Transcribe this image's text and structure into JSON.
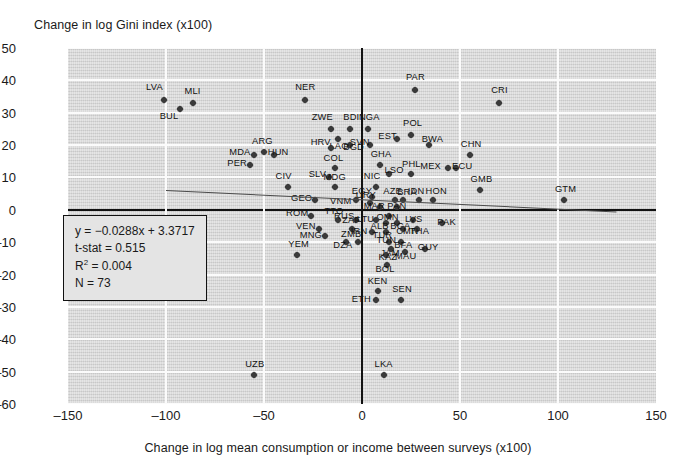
{
  "chart_data": {
    "type": "scatter",
    "title": "",
    "ylabel": "Change in log Gini index (x100)",
    "xlabel": "Change in log mean consumption or income between surveys (x100)",
    "xlim": [
      -150,
      150
    ],
    "ylim": [
      -60,
      50
    ],
    "xticks": [
      -150,
      -100,
      -50,
      0,
      50,
      100,
      150
    ],
    "yticks": [
      50,
      40,
      30,
      20,
      10,
      0,
      -10,
      -20,
      -30,
      -40,
      -50,
      -60
    ],
    "xtick_labels": [
      "–150",
      "–100",
      "–50",
      "0",
      "50",
      "100",
      "150"
    ],
    "ytick_labels": [
      "50",
      "40",
      "30",
      "20",
      "10",
      "0",
      "–10",
      "–20",
      "–30",
      "–40",
      "–50",
      "–60"
    ],
    "grid": true,
    "legend": "none",
    "fit_line": {
      "slope": -0.0288,
      "intercept": 3.3717,
      "x_from": -100,
      "x_to": 130
    },
    "annotation": {
      "equation": "y = −0.0288x + 3.3717",
      "t_stat": "t-stat = 0.515",
      "r_squared_label": "R",
      "r_squared_sup": "2",
      "r_squared_value": " = 0.004",
      "n": "N = 73"
    },
    "points": [
      {
        "label": "LVA",
        "x": -101,
        "y": 34,
        "lx": -10,
        "ly": -13
      },
      {
        "label": "MLI",
        "x": -86,
        "y": 33,
        "lx": -1,
        "ly": -12
      },
      {
        "label": "BUL",
        "x": -93,
        "y": 31,
        "lx": -12,
        "ly": 7
      },
      {
        "label": "NER",
        "x": -29,
        "y": 34,
        "lx": -2,
        "ly": -13
      },
      {
        "label": "PAR",
        "x": 27,
        "y": 37,
        "lx": -1,
        "ly": -13
      },
      {
        "label": "CRI",
        "x": 70,
        "y": 33,
        "lx": 0,
        "ly": -13
      },
      {
        "label": "ZWE",
        "x": -16,
        "y": 25,
        "lx": -11,
        "ly": -12
      },
      {
        "label": "BDI",
        "x": -6,
        "y": 25,
        "lx": 1,
        "ly": -12
      },
      {
        "label": "LAO",
        "x": -12,
        "y": 22,
        "lx": -1,
        "ly": 7
      },
      {
        "label": "NGA",
        "x": 3,
        "y": 25,
        "lx": -1,
        "ly": -12
      },
      {
        "label": "POL",
        "x": 25,
        "y": 23,
        "lx": 0,
        "ly": -12
      },
      {
        "label": "EST",
        "x": 18,
        "y": 22,
        "lx": -11,
        "ly": -3
      },
      {
        "label": "SVN",
        "x": 4,
        "y": 20,
        "lx": -12,
        "ly": -3
      },
      {
        "label": "BWA",
        "x": 34,
        "y": 20,
        "lx": 1,
        "ly": -6
      },
      {
        "label": "BGD",
        "x": -6,
        "y": 20,
        "lx": 1,
        "ly": 2
      },
      {
        "label": "HRV",
        "x": -16,
        "y": 19,
        "lx": -12,
        "ly": -6
      },
      {
        "label": "ARG",
        "x": -50,
        "y": 18,
        "lx": -4,
        "ly": -11
      },
      {
        "label": "HUN",
        "x": -45,
        "y": 17,
        "lx": 2,
        "ly": -3
      },
      {
        "label": "MDA",
        "x": -55,
        "y": 17,
        "lx": -17,
        "ly": -3
      },
      {
        "label": "CHN",
        "x": 55,
        "y": 17,
        "lx": -1,
        "ly": -11
      },
      {
        "label": "PER",
        "x": -57,
        "y": 14,
        "lx": -15,
        "ly": -2
      },
      {
        "label": "COL",
        "x": -14,
        "y": 13,
        "lx": -3,
        "ly": -10
      },
      {
        "label": "GHA",
        "x": 9,
        "y": 14,
        "lx": -1,
        "ly": -11
      },
      {
        "label": "MEX",
        "x": 44,
        "y": 13,
        "lx": -20,
        "ly": -2
      },
      {
        "label": "ECU",
        "x": 48,
        "y": 13,
        "lx": 4,
        "ly": -2
      },
      {
        "label": "SLV",
        "x": -17,
        "y": 10,
        "lx": -12,
        "ly": -3
      },
      {
        "label": "LSO",
        "x": 14,
        "y": 11,
        "lx": 3,
        "ly": -4
      },
      {
        "label": "PHL",
        "x": 25,
        "y": 11,
        "lx": -1,
        "ly": -10
      },
      {
        "label": "CIV",
        "x": -38,
        "y": 7,
        "lx": -4,
        "ly": -11
      },
      {
        "label": "MDG",
        "x": -14,
        "y": 7,
        "lx": -3,
        "ly": -10
      },
      {
        "label": "NIC",
        "x": 7,
        "y": 7,
        "lx": -4,
        "ly": -11
      },
      {
        "label": "GMB",
        "x": 60,
        "y": 6,
        "lx": -1,
        "ly": -11
      },
      {
        "label": "GTM",
        "x": 103,
        "y": 3,
        "lx": -1,
        "ly": -11
      },
      {
        "label": "GEO",
        "x": -24,
        "y": 3,
        "lx": -16,
        "ly": -2
      },
      {
        "label": "VNM",
        "x": -3,
        "y": 3,
        "lx": -18,
        "ly": 1
      },
      {
        "label": "EGY",
        "x": 5,
        "y": 4,
        "lx": -12,
        "ly": -6
      },
      {
        "label": "URY",
        "x": 4,
        "y": 2,
        "lx": -6,
        "ly": -8
      },
      {
        "label": "AZE",
        "x": 17,
        "y": 3,
        "lx": -4,
        "ly": -9
      },
      {
        "label": "BRA",
        "x": 21,
        "y": 3,
        "lx": 2,
        "ly": -8
      },
      {
        "label": "IDN",
        "x": 29,
        "y": 3,
        "lx": -3,
        "ly": -9
      },
      {
        "label": "HON",
        "x": 36,
        "y": 3,
        "lx": 1,
        "ly": -9
      },
      {
        "label": "MAR",
        "x": 9,
        "y": 1,
        "lx": -8,
        "ly": -1
      },
      {
        "label": "PAN",
        "x": 18,
        "y": 1,
        "lx": -2,
        "ly": -1
      },
      {
        "label": "ROM",
        "x": -26,
        "y": -2,
        "lx": -17,
        "ly": -3
      },
      {
        "label": "TTO",
        "x": -12,
        "y": -3,
        "lx": -6,
        "ly": -9
      },
      {
        "label": "RUS",
        "x": -3,
        "y": -3,
        "lx": -14,
        "ly": -4
      },
      {
        "label": "OMN",
        "x": 14,
        "y": -2,
        "lx": -5,
        "ly": 1
      },
      {
        "label": "LTU",
        "x": 7,
        "y": -3,
        "lx": -11,
        "ly": -1
      },
      {
        "label": "ALB",
        "x": 12,
        "y": -4,
        "lx": -7,
        "ly": 3
      },
      {
        "label": "BGA",
        "x": 18,
        "y": -4,
        "lx": 1,
        "ly": 3
      },
      {
        "label": "LVS",
        "x": 26,
        "y": -3,
        "lx": 0,
        "ly": -1
      },
      {
        "label": "PAK",
        "x": 41,
        "y": -4,
        "lx": 3,
        "ly": -1
      },
      {
        "label": "VEN",
        "x": -22,
        "y": -6,
        "lx": -15,
        "ly": -3
      },
      {
        "label": "ZAF",
        "x": -5,
        "y": -6,
        "lx": -2,
        "ly": -9
      },
      {
        "label": "IRN",
        "x": 5,
        "y": -7,
        "lx": -13,
        "ly": -1
      },
      {
        "label": "TUR",
        "x": 12,
        "y": -7,
        "lx": -5,
        "ly": 3
      },
      {
        "label": "CMR",
        "x": 21,
        "y": -6,
        "lx": 1,
        "ly": 2
      },
      {
        "label": "THA",
        "x": 28,
        "y": -6,
        "lx": 1,
        "ly": 2
      },
      {
        "label": "MNG",
        "x": -19,
        "y": -8,
        "lx": -17,
        "ly": -1
      },
      {
        "label": "ZMB",
        "x": -2,
        "y": -10,
        "lx": -9,
        "ly": -8
      },
      {
        "label": "DZA",
        "x": -8,
        "y": -10,
        "lx": -5,
        "ly": 3
      },
      {
        "label": "TUN",
        "x": 14,
        "y": -10,
        "lx": -5,
        "ly": -2
      },
      {
        "label": "BFA",
        "x": 20,
        "y": -10,
        "lx": 1,
        "ly": 3
      },
      {
        "label": "JAM",
        "x": 15,
        "y": -12,
        "lx": -3,
        "ly": 4
      },
      {
        "label": "MAU",
        "x": 22,
        "y": -13,
        "lx": -2,
        "ly": 4
      },
      {
        "label": "GUY",
        "x": 32,
        "y": -12,
        "lx": 1,
        "ly": -2
      },
      {
        "label": "KAZ",
        "x": 12,
        "y": -14,
        "lx": 1,
        "ly": 2
      },
      {
        "label": "YEM",
        "x": -33,
        "y": -14,
        "lx": -1,
        "ly": -11
      },
      {
        "label": "BOL",
        "x": 13,
        "y": -17,
        "lx": -4,
        "ly": 4
      },
      {
        "label": "KEN",
        "x": 8,
        "y": -25,
        "lx": -2,
        "ly": -10
      },
      {
        "label": "ETH",
        "x": 7,
        "y": -28,
        "lx": -16,
        "ly": -1
      },
      {
        "label": "SEN",
        "x": 20,
        "y": -28,
        "lx": -1,
        "ly": -11
      },
      {
        "label": "UZB",
        "x": -55,
        "y": -51,
        "lx": -1,
        "ly": -11
      },
      {
        "label": "LKA",
        "x": 11,
        "y": -51,
        "lx": -1,
        "ly": -11
      }
    ]
  }
}
